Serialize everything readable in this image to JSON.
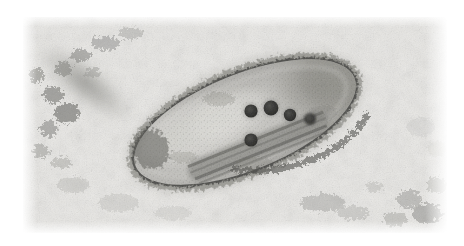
{
  "page": {
    "background_color": "#ffffff",
    "width": 464,
    "height": 246
  },
  "micrograph": {
    "name": "transmission-electron-micrograph",
    "caption": "",
    "modality": "transmission electron microscopy",
    "color_mode": "grayscale",
    "plate": {
      "x": 23,
      "y": 17,
      "width": 424,
      "height": 216
    },
    "background_color": "#e9e8e5",
    "film_grain": "fine mottled support film",
    "subject": "rod-shaped bacterium in thin section"
  },
  "specimen": {
    "label": "bacterium",
    "shape": "elongated rod / ellipse",
    "center": {
      "x": 245,
      "y": 122
    },
    "length": 236,
    "width": 96,
    "rotation_deg": -22,
    "envelope_color": "#6b6b68",
    "cytoplasm_color": "#bdbcb8"
  },
  "granules": {
    "label": "electron-dense granules",
    "count": 5,
    "fill_color": "#3a3a38",
    "items": [
      {
        "name": "granule-1",
        "cx": 251,
        "cy": 111,
        "r": 7.0
      },
      {
        "name": "granule-2",
        "cx": 271,
        "cy": 108,
        "r": 7.6
      },
      {
        "name": "granule-3",
        "cx": 290,
        "cy": 115,
        "r": 6.6
      },
      {
        "name": "granule-4",
        "cx": 310,
        "cy": 119,
        "r": 6.2
      },
      {
        "name": "granule-5",
        "cx": 251,
        "cy": 140,
        "r": 7.0
      }
    ]
  },
  "internal_lamella": {
    "label": "internal lamellar band",
    "color": "#7d7d79",
    "rotation_deg": -22
  },
  "debris": {
    "label": "background debris clusters",
    "color": "#8a8a86",
    "regions": [
      {
        "name": "debris-upper-left-band",
        "cx": 80,
        "cy": 80,
        "rx": 58,
        "ry": 72,
        "rotation_deg": -55
      },
      {
        "name": "debris-lower-right",
        "cx": 400,
        "cy": 205,
        "rx": 48,
        "ry": 28,
        "rotation_deg": 20
      },
      {
        "name": "debris-lower-center",
        "cx": 300,
        "cy": 200,
        "rx": 44,
        "ry": 18,
        "rotation_deg": 8
      }
    ]
  }
}
